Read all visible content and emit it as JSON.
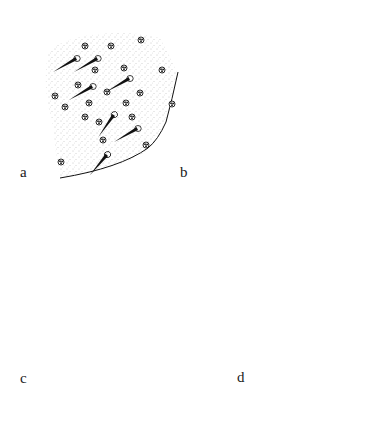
{
  "figure": {
    "panels": [
      {
        "id": "a",
        "label": "a",
        "description": "skin surface stippled patch with oblique conical spines and pores"
      },
      {
        "id": "b",
        "label": "b",
        "description": "enlarged spines and long setae with pores and glandular openings"
      },
      {
        "id": "c",
        "label": "c",
        "description": "side view of skin with erect hairs and conical spines"
      },
      {
        "id": "d",
        "label": "d",
        "description": "section with line, hairs, spines and pores"
      }
    ],
    "colors": {
      "ink": "#111111",
      "stipple": "#9a9a9a",
      "background": "#ffffff"
    }
  }
}
